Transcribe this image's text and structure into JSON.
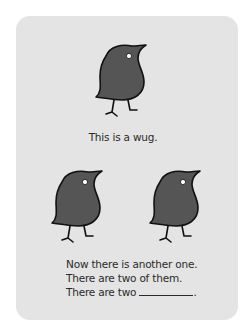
{
  "card": {
    "background": "#e4e4e4",
    "bird_fill": "#555555",
    "stroke": "#111111"
  },
  "figure_top": {
    "icon": "wug-bird-icon",
    "caption": "This is a wug."
  },
  "figure_bottom": {
    "icons": [
      "wug-bird-icon",
      "wug-bird-icon"
    ],
    "lines": [
      "Now there is another one.",
      "There are two of them.",
      "There are two"
    ],
    "blank_suffix": "."
  }
}
